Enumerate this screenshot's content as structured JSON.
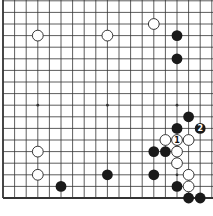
{
  "diagram": {
    "type": "go-board",
    "board_size": 19,
    "visible_columns": 19,
    "visible_rows": 18,
    "grid": {
      "origin_x": 3,
      "origin_y": 0.8,
      "spacing": 11.6
    },
    "edges": {
      "left": true,
      "bottom": true,
      "top": false,
      "right": false
    },
    "colors": {
      "line": "#333333",
      "black_stone": "#1a1a1a",
      "white_stone": "#ffffff",
      "stone_outline": "#222222"
    },
    "star_points": [
      {
        "col": 3,
        "row": 3
      },
      {
        "col": 9,
        "row": 3
      },
      {
        "col": 15,
        "row": 3
      },
      {
        "col": 3,
        "row": 9
      },
      {
        "col": 9,
        "row": 9
      },
      {
        "col": 15,
        "row": 9
      },
      {
        "col": 3,
        "row": 15
      },
      {
        "col": 9,
        "row": 15
      },
      {
        "col": 15,
        "row": 15
      }
    ],
    "stones": [
      {
        "color": "white",
        "col": 3,
        "row": 3,
        "label": ""
      },
      {
        "color": "white",
        "col": 9,
        "row": 3,
        "label": ""
      },
      {
        "color": "white",
        "col": 13,
        "row": 2,
        "label": ""
      },
      {
        "color": "black",
        "col": 15,
        "row": 3,
        "label": ""
      },
      {
        "color": "black",
        "col": 15,
        "row": 5,
        "label": ""
      },
      {
        "color": "black",
        "col": 16,
        "row": 10,
        "label": ""
      },
      {
        "color": "black",
        "col": 15,
        "row": 11,
        "label": ""
      },
      {
        "color": "black",
        "col": 17,
        "row": 11,
        "label": "2"
      },
      {
        "color": "white",
        "col": 14,
        "row": 12,
        "label": ""
      },
      {
        "color": "white",
        "col": 15,
        "row": 12,
        "label": "1"
      },
      {
        "color": "white",
        "col": 16,
        "row": 12,
        "label": ""
      },
      {
        "color": "black",
        "col": 13,
        "row": 13,
        "label": ""
      },
      {
        "color": "black",
        "col": 14,
        "row": 13,
        "label": ""
      },
      {
        "color": "white",
        "col": 15,
        "row": 13,
        "label": ""
      },
      {
        "color": "white",
        "col": 15,
        "row": 14,
        "label": ""
      },
      {
        "color": "black",
        "col": 13,
        "row": 15,
        "label": ""
      },
      {
        "color": "white",
        "col": 16,
        "row": 15,
        "label": ""
      },
      {
        "color": "black",
        "col": 15,
        "row": 16,
        "label": ""
      },
      {
        "color": "white",
        "col": 16,
        "row": 16,
        "label": ""
      },
      {
        "color": "black",
        "col": 16,
        "row": 17,
        "label": ""
      },
      {
        "color": "black",
        "col": 17,
        "row": 17,
        "label": ""
      },
      {
        "color": "white",
        "col": 3,
        "row": 13,
        "label": ""
      },
      {
        "color": "white",
        "col": 3,
        "row": 15,
        "label": ""
      },
      {
        "color": "black",
        "col": 5,
        "row": 16,
        "label": ""
      },
      {
        "color": "black",
        "col": 9,
        "row": 15,
        "label": ""
      }
    ]
  }
}
